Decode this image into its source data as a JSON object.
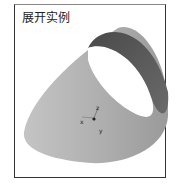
{
  "panel": {
    "title": "展开实例"
  },
  "model": {
    "shape": "truncated-cone",
    "fill_color": "#a8a8a8",
    "inner_color": "#ffffff",
    "shadow_color": "#555555"
  },
  "axes": {
    "x_label": "x",
    "y_label": "y",
    "z_label": "z"
  }
}
